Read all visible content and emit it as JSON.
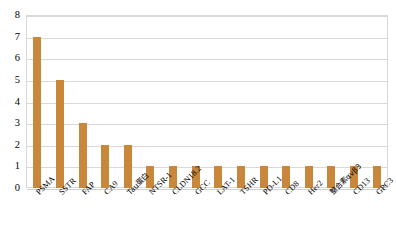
{
  "chart_data": {
    "type": "bar",
    "title": "",
    "subtitle": "",
    "xlabel": "",
    "ylabel": "",
    "ylim": [
      0,
      8
    ],
    "ytick_step": 1,
    "yticks": [
      "8",
      "7",
      "6",
      "5",
      "4",
      "3",
      "2",
      "1",
      "0"
    ],
    "grid": true,
    "grid_axis": "y",
    "legend": false,
    "legend_position": "none",
    "bar_color": "#c8873a",
    "gridline_color": "#d9d9d9",
    "plot_border_color": "#d9d9d9",
    "categories": [
      "PSMA",
      "SSTR",
      "FAP",
      "CA9",
      "Tau蛋白",
      "NTSR-1",
      "CLDN18.2",
      "GCC",
      "LAT-1",
      "TSHR",
      "PD-L1",
      "CD8",
      "Her2",
      "整合素αvβ3",
      "CD13",
      "GPC3"
    ],
    "values": [
      7,
      5,
      3,
      2,
      2,
      1,
      1,
      1,
      1,
      1,
      1,
      1,
      1,
      1,
      1,
      1
    ]
  }
}
